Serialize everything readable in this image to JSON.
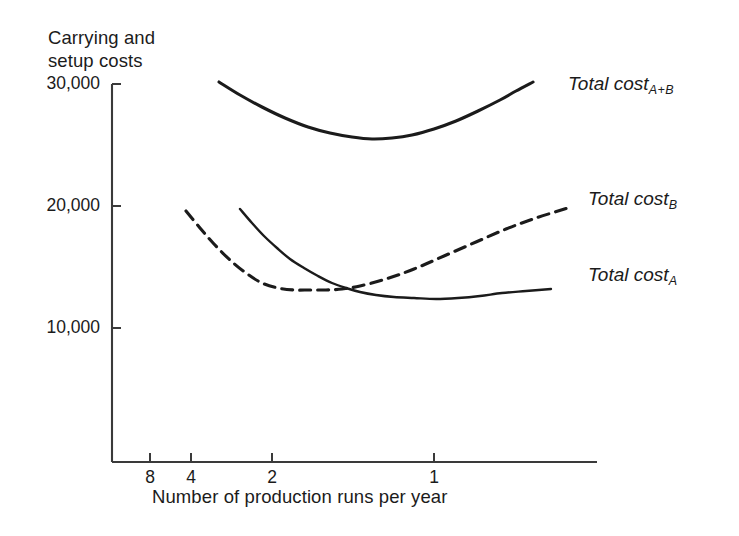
{
  "chart_data": {
    "type": "line",
    "title": "",
    "ylabel": "Carrying and\nsetup costs",
    "xlabel": "Number of production runs per year",
    "grid": false,
    "legend_position": "right-inline",
    "y_axis": {
      "ticks": [
        {
          "label": "30,000",
          "value": 30000,
          "px_y": 84
        },
        {
          "label": "20,000",
          "value": 20000,
          "px_y": 206
        },
        {
          "label": "10,000",
          "value": 10000,
          "px_y": 328
        }
      ],
      "ylim": [
        0,
        31500
      ],
      "scale": "linear"
    },
    "x_axis": {
      "ticks": [
        {
          "label": "8",
          "value": 8,
          "px_x": 150
        },
        {
          "label": "4",
          "value": 4,
          "px_x": 191
        },
        {
          "label": "2",
          "value": 2,
          "px_x": 272
        },
        {
          "label": "1",
          "value": 1,
          "px_x": 434
        }
      ],
      "scale": "log-reversed",
      "note": "runs per year decreasing left to right"
    },
    "series": [
      {
        "name": "Total cost A+B",
        "label_text": "Total cost",
        "label_sub": "A+B",
        "style": "solid",
        "linewidth": 3.1,
        "color": "#1b1b1b",
        "points": [
          [
            219,
            82
          ],
          [
            240,
            95
          ],
          [
            262,
            107
          ],
          [
            285,
            118
          ],
          [
            308,
            127
          ],
          [
            330,
            133
          ],
          [
            352,
            137
          ],
          [
            372,
            139
          ],
          [
            392,
            138
          ],
          [
            412,
            135
          ],
          [
            434,
            129
          ],
          [
            456,
            121
          ],
          [
            478,
            111
          ],
          [
            500,
            100
          ],
          [
            516,
            91
          ],
          [
            533,
            82
          ]
        ]
      },
      {
        "name": "Total cost B",
        "label_text": "Total cost",
        "label_sub": "B",
        "style": "dashed",
        "linewidth": 3.1,
        "dash": "11 7",
        "color": "#1b1b1b",
        "points": [
          [
            186,
            211
          ],
          [
            200,
            228
          ],
          [
            214,
            244
          ],
          [
            230,
            260
          ],
          [
            246,
            273
          ],
          [
            262,
            283
          ],
          [
            278,
            288
          ],
          [
            294,
            290
          ],
          [
            310,
            290
          ],
          [
            326,
            290
          ],
          [
            342,
            289
          ],
          [
            360,
            286
          ],
          [
            386,
            279
          ],
          [
            414,
            269
          ],
          [
            444,
            256
          ],
          [
            476,
            242
          ],
          [
            506,
            229
          ],
          [
            536,
            218
          ],
          [
            568,
            208
          ]
        ]
      },
      {
        "name": "Total cost A",
        "label_text": "Total cost",
        "label_sub": "A",
        "style": "solid",
        "linewidth": 2.4,
        "color": "#1b1b1b",
        "points": [
          [
            240,
            209
          ],
          [
            252,
            223
          ],
          [
            264,
            236
          ],
          [
            277,
            248
          ],
          [
            290,
            259
          ],
          [
            304,
            268
          ],
          [
            318,
            276
          ],
          [
            332,
            283
          ],
          [
            346,
            288
          ],
          [
            360,
            292
          ],
          [
            376,
            295
          ],
          [
            394,
            297
          ],
          [
            414,
            298
          ],
          [
            436,
            299
          ],
          [
            458,
            298
          ],
          [
            480,
            296
          ],
          [
            502,
            293
          ],
          [
            526,
            291
          ],
          [
            551,
            289
          ]
        ]
      }
    ],
    "axis_geometry": {
      "y_axis_px_x": 112,
      "y_axis_top_px_y": 84,
      "x_axis_px_y": 462,
      "x_axis_right_px_x": 597,
      "tick_len": 9
    },
    "labels": {
      "total_cost_ab": {
        "x": 568,
        "y": 73
      },
      "total_cost_b": {
        "x": 588,
        "y": 188
      },
      "total_cost_a": {
        "x": 588,
        "y": 264
      }
    }
  }
}
